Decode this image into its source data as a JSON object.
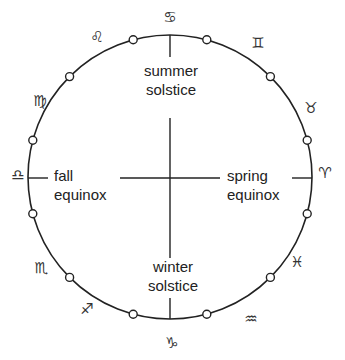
{
  "diagram": {
    "title": "",
    "circle": {
      "cx": 170,
      "cy": 177,
      "r": 142,
      "stroke": "#222222"
    },
    "labels": {
      "summer": {
        "line1": "summer",
        "line2": "solstice"
      },
      "winter": {
        "line1": "winter",
        "line2": "solstice"
      },
      "spring": {
        "line1": "spring",
        "line2": "equinox"
      },
      "fall": {
        "line1": "fall",
        "line2": "equinox"
      }
    },
    "zodiac": [
      {
        "name": "aries",
        "glyph": "♈",
        "x": 325,
        "y": 173
      },
      {
        "name": "taurus",
        "glyph": "♉",
        "x": 311,
        "y": 108
      },
      {
        "name": "gemini",
        "glyph": "♊",
        "x": 258,
        "y": 43
      },
      {
        "name": "cancer",
        "glyph": "♋",
        "x": 170,
        "y": 17
      },
      {
        "name": "leo",
        "glyph": "♌",
        "x": 97,
        "y": 37
      },
      {
        "name": "virgo",
        "glyph": "♍",
        "x": 40,
        "y": 101
      },
      {
        "name": "libra",
        "glyph": "♎",
        "x": 18,
        "y": 175
      },
      {
        "name": "scorpio",
        "glyph": "♏",
        "x": 41,
        "y": 268
      },
      {
        "name": "sagittarius",
        "glyph": "♐",
        "x": 87,
        "y": 309
      },
      {
        "name": "capricorn",
        "glyph": "♑",
        "x": 172,
        "y": 343
      },
      {
        "name": "aquarius",
        "glyph": "♒",
        "x": 251,
        "y": 319
      },
      {
        "name": "pisces",
        "glyph": "♓",
        "x": 297,
        "y": 262
      }
    ]
  }
}
